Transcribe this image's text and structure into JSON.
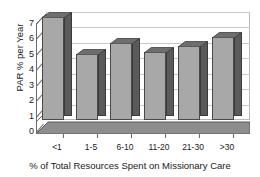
{
  "chart_data": {
    "type": "bar",
    "title": "",
    "xlabel": "% of Total Resources Spent on Missionary Care",
    "ylabel": "PAR % per Year",
    "categories": [
      "<1",
      "1-5",
      "6-10",
      "11-20",
      "21-30",
      ">30"
    ],
    "values": [
      6.7,
      4.3,
      5.0,
      4.4,
      4.8,
      5.4
    ],
    "ylim": [
      0,
      7
    ],
    "yticks": [
      0,
      1,
      2,
      3,
      4,
      5,
      6,
      7
    ],
    "ytick_labels": [
      "0",
      "1",
      "2",
      "3",
      "4",
      "5",
      "6",
      "7"
    ],
    "grid": true,
    "legend": false,
    "style": "3d-column",
    "colors": {
      "bar_front": "#a8a8a8",
      "bar_side": "#5a5a5a",
      "bar_top": "#6e6e6e",
      "gridline": "#c9c9c9",
      "axis": "#6b6b6b",
      "floor": "#7a7a7a",
      "background": "#ffffff"
    }
  }
}
